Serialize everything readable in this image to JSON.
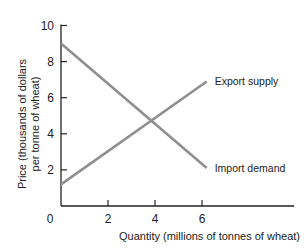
{
  "chart_data": {
    "type": "line",
    "title": "",
    "xlabel": "Quantity (millions of tonnes of wheat)",
    "ylabel_line1": "Price (thousands of dollars",
    "ylabel_line2": "per tonne of wheat)",
    "xlim": [
      0,
      9.8
    ],
    "ylim": [
      0,
      10
    ],
    "grid": false,
    "origin_label": "0",
    "x_ticks": [
      2,
      4,
      6
    ],
    "x_tick_labels": [
      "2",
      "4",
      "6"
    ],
    "y_ticks": [
      2,
      4,
      6,
      8,
      10
    ],
    "y_tick_labels": [
      "2",
      "4",
      "6",
      "8",
      "10"
    ],
    "series": [
      {
        "name": "Import demand",
        "x": [
          0,
          6.2
        ],
        "y": [
          9,
          2.1
        ],
        "color": "#8f8f8f"
      },
      {
        "name": "Export supply",
        "x": [
          0,
          6.2
        ],
        "y": [
          1.2,
          6.9
        ],
        "color": "#8f8f8f"
      }
    ],
    "intersection": {
      "x": 4,
      "y": 5
    }
  }
}
